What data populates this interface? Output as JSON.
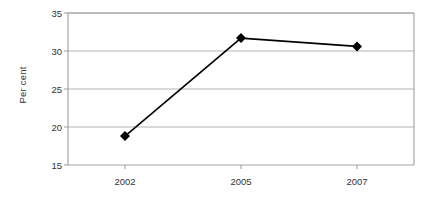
{
  "chart_data": {
    "type": "line",
    "title": "",
    "subtitle": "",
    "xlabel": "",
    "ylabel": "Per cent",
    "categories": [
      "2002",
      "2005",
      "2007"
    ],
    "values": [
      18.8,
      31.7,
      30.6
    ],
    "series": [
      {
        "name": "Per cent",
        "values": [
          18.8,
          31.7,
          30.6
        ],
        "line_color": "#000000",
        "marker": "diamond",
        "marker_color": "#000000"
      }
    ],
    "ylim": [
      15,
      35
    ],
    "yticks": [
      15,
      20,
      25,
      30,
      35
    ],
    "ytick_labels": [
      "15",
      "20",
      "25",
      "30",
      "35"
    ],
    "xtick_labels": [
      "2002",
      "2005",
      "2007"
    ],
    "grid": "horizontal",
    "legend": "none",
    "plot_background": "#ffffff",
    "gridline_color": "#b3b3b3",
    "frame_color": "#a6a6a6"
  }
}
